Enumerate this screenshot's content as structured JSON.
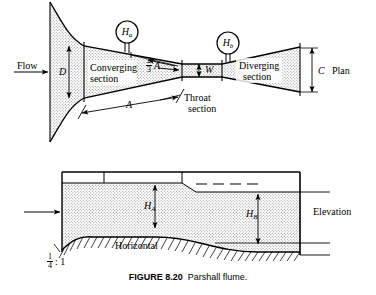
{
  "figure": {
    "caption_bold": "FIGURE 8.20",
    "caption_rest": "Parshall flume."
  },
  "plan_view": {
    "view_label": "Plan",
    "flow_label": "Flow",
    "gauge_a_label": "H",
    "gauge_a_sub": "a",
    "gauge_b_label": "H",
    "gauge_b_sub": "b",
    "dim_d": "D",
    "dim_c": "C",
    "dim_w": "W",
    "dim_a": "A",
    "dim_two_thirds_num": "2",
    "dim_two_thirds_den": "3",
    "dim_two_thirds_letter": "A",
    "converging_line1": "Converging",
    "converging_line2": "section",
    "throat_line1": "Throat",
    "throat_line2": "section",
    "diverging_line1": "Diverging",
    "diverging_line2": "section"
  },
  "elevation_view": {
    "view_label": "Elevation",
    "head_a": "H",
    "head_a_sub": "A",
    "head_b": "H",
    "head_b_sub": "B",
    "horizontal_label": "Horizontal",
    "slope_num": "1",
    "slope_den": "4",
    "slope_ratio": ": 1"
  },
  "colors": {
    "line": "#000000",
    "hatch": "#9a9a9a",
    "background": "#ffffff"
  }
}
